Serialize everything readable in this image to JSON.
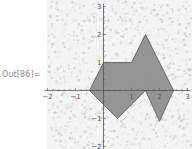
{
  "cell": {
    "output_label": "Out[86]="
  },
  "colors": {
    "background": "#ffffff",
    "noise_speck": "#dcdcdc",
    "polygon_fill": "#8c8c8c",
    "polygon_edge": "#555555",
    "axis": "#555555",
    "label_gray": "#8a8a8a"
  },
  "chart_data": {
    "type": "polygon",
    "title": "",
    "xlabel": "",
    "ylabel": "",
    "xlim": [
      -2.1,
      3.1
    ],
    "ylim": [
      -2.1,
      3.1
    ],
    "x_ticks": [
      -2,
      -1,
      1,
      2,
      3
    ],
    "y_ticks": [
      -2,
      -1,
      1,
      2,
      3
    ],
    "grid": false,
    "background": "textured noise",
    "polygon_vertices": [
      [
        -0.5,
        0
      ],
      [
        0,
        1
      ],
      [
        1,
        1
      ],
      [
        1.5,
        2
      ],
      [
        2.5,
        0
      ],
      [
        2,
        -1.1
      ],
      [
        1.5,
        0
      ],
      [
        0.5,
        -1
      ],
      [
        0,
        -0.5
      ]
    ]
  },
  "layout": {
    "origin_px": [
      103.5,
      90.5
    ],
    "unit_px": 28,
    "plot_left": 47,
    "plot_right": 192,
    "plot_top": 0,
    "plot_bottom": 149
  }
}
